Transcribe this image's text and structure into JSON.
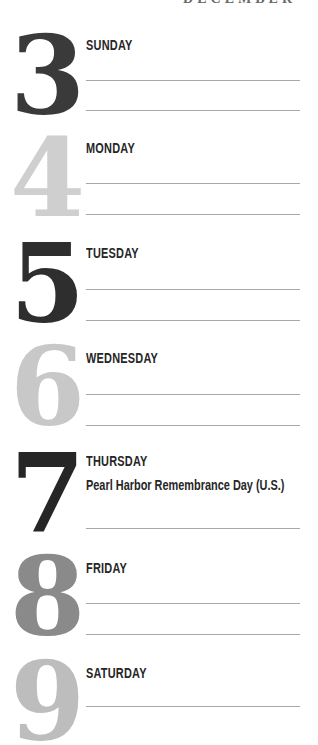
{
  "header": {
    "month": "DECEMBER"
  },
  "days": [
    {
      "number": "3",
      "name": "SUNDAY",
      "color": "#3a3a3a",
      "note": ""
    },
    {
      "number": "4",
      "name": "MONDAY",
      "color": "#cfcfcf",
      "note": ""
    },
    {
      "number": "5",
      "name": "TUESDAY",
      "color": "#2e2e2e",
      "note": ""
    },
    {
      "number": "6",
      "name": "WEDNESDAY",
      "color": "#c8c8c8",
      "note": ""
    },
    {
      "number": "7",
      "name": "THURSDAY",
      "color": "#262626",
      "note": "Pearl Harbor Remembrance Day (U.S.)"
    },
    {
      "number": "8",
      "name": "FRIDAY",
      "color": "#8a8a8a",
      "note": ""
    },
    {
      "number": "9",
      "name": "SATURDAY",
      "color": "#bdbdbd",
      "note": ""
    }
  ]
}
